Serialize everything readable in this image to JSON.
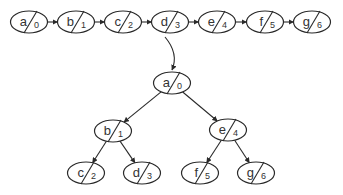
{
  "diagram": {
    "type": "linked-list-to-balanced-bst",
    "list": {
      "nodes": [
        {
          "label": "a",
          "index": "0",
          "cx": 29,
          "cy": 22
        },
        {
          "label": "b",
          "index": "1",
          "cx": 76,
          "cy": 22
        },
        {
          "label": "c",
          "index": "2",
          "cx": 123,
          "cy": 22
        },
        {
          "label": "d",
          "index": "3",
          "cx": 170,
          "cy": 22
        },
        {
          "label": "e",
          "index": "4",
          "cx": 217,
          "cy": 22
        },
        {
          "label": "f",
          "index": "5",
          "cx": 265,
          "cy": 22
        },
        {
          "label": "g",
          "index": "6",
          "cx": 312,
          "cy": 22
        }
      ]
    },
    "transform_arrow": {
      "from": [
        165,
        37
      ],
      "to": [
        172,
        70
      ]
    },
    "tree": {
      "nodes": [
        {
          "id": "a",
          "label": "a",
          "index": "0",
          "cx": 172,
          "cy": 83
        },
        {
          "id": "b",
          "label": "b",
          "index": "1",
          "cx": 113,
          "cy": 131
        },
        {
          "id": "e",
          "label": "e",
          "index": "4",
          "cx": 228,
          "cy": 130
        },
        {
          "id": "c",
          "label": "c",
          "index": "2",
          "cx": 86,
          "cy": 173
        },
        {
          "id": "d",
          "label": "d",
          "index": "3",
          "cx": 142,
          "cy": 173
        },
        {
          "id": "f",
          "label": "f",
          "index": "5",
          "cx": 200,
          "cy": 173
        },
        {
          "id": "g",
          "label": "g",
          "index": "6",
          "cx": 256,
          "cy": 173
        }
      ],
      "edges": [
        {
          "from": "a",
          "to": "b"
        },
        {
          "from": "a",
          "to": "e"
        },
        {
          "from": "b",
          "to": "c"
        },
        {
          "from": "b",
          "to": "d"
        },
        {
          "from": "e",
          "to": "f"
        },
        {
          "from": "e",
          "to": "g"
        }
      ]
    },
    "colors": {
      "stroke": "#2a2a2a",
      "text": "#333333",
      "background": "#ffffff"
    }
  }
}
